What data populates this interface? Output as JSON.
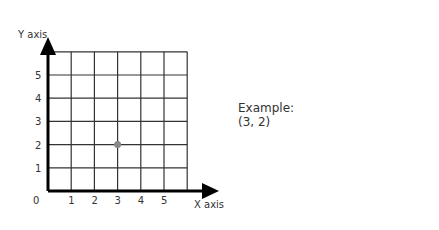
{
  "chart_data": {
    "type": "scatter",
    "title": "",
    "xlabel": "X axis",
    "ylabel": "Y axis",
    "origin_label": "0",
    "x_ticks": [
      "1",
      "2",
      "3",
      "4",
      "5"
    ],
    "y_ticks": [
      "1",
      "2",
      "3",
      "4",
      "5"
    ],
    "xlim": [
      0,
      6
    ],
    "ylim": [
      0,
      6
    ],
    "grid": true,
    "series": [
      {
        "name": "Example point",
        "points": [
          {
            "x": 3,
            "y": 2
          }
        ],
        "color": "#888888"
      }
    ]
  },
  "annotation": {
    "line1": "Example:",
    "line2": "(3, 2)"
  },
  "colors": {
    "axis": "#000000",
    "grid": "#333333",
    "point": "#888888"
  }
}
